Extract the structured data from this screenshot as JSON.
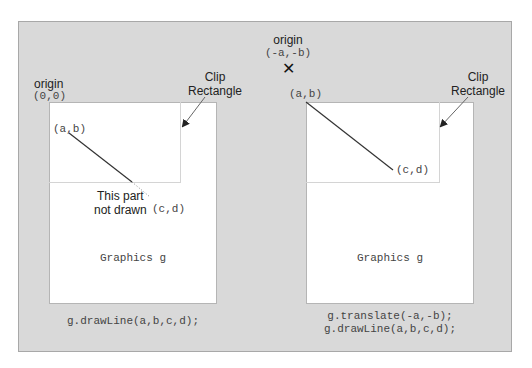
{
  "left_panel": {
    "origin_label": "origin",
    "origin_coords": "(0,0)",
    "clip_label_line1": "Clip",
    "clip_label_line2": "Rectangle",
    "start_point": "(a,b)",
    "end_point": "(c,d)",
    "not_drawn_line1": "This part",
    "not_drawn_line2": "not drawn",
    "graphics_label": "Graphics g",
    "code_line1": "g.drawLine(a,b,c,d);"
  },
  "right_panel": {
    "origin_label": "origin",
    "origin_coords": "(-a,-b)",
    "origin_marker": "✕",
    "clip_label_line1": "Clip",
    "clip_label_line2": "Rectangle",
    "start_point": "(a,b)",
    "end_point": "(c,d)",
    "graphics_label": "Graphics g",
    "code_line1": "g.translate(-a,-b);",
    "code_line2": "g.drawLine(a,b,c,d);"
  },
  "colors": {
    "background": "#d9d9d9",
    "graphics_area": "#ffffff",
    "line": "#333333",
    "arrow": "#555555"
  }
}
